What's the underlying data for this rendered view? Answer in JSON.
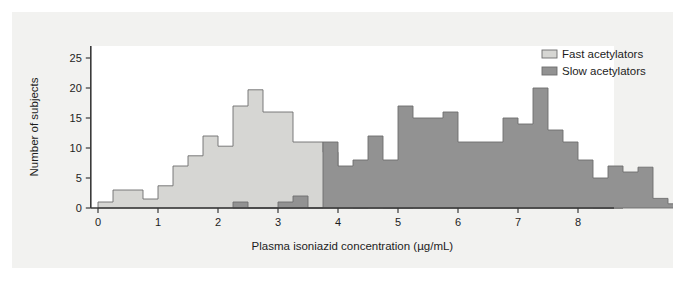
{
  "figure": {
    "background_color": "#f2f2f0",
    "plot_background_color": "#ffffff"
  },
  "chart_data": {
    "type": "bar",
    "title": "",
    "xlabel": "Plasma isoniazid concentration (µg/mL)",
    "ylabel": "Number of subjects",
    "xlim": [
      -0.12,
      8.6
    ],
    "ylim": [
      0,
      27
    ],
    "xticks": [
      0,
      1,
      2,
      3,
      4,
      5,
      6,
      7,
      8
    ],
    "xticklabels": [
      "0",
      "1",
      "2",
      "3",
      "4",
      "5",
      "6",
      "7",
      "8"
    ],
    "yticks": [
      0,
      5,
      10,
      15,
      20,
      25
    ],
    "yticklabels": [
      "0",
      "5",
      "10",
      "15",
      "20",
      "25"
    ],
    "grid": false,
    "bin_width": 0.25,
    "legend_position": "top-right",
    "legend": [
      {
        "name": "Fast acetylators",
        "color": "#d6d6d3"
      },
      {
        "name": "Slow acetylators",
        "color": "#929292"
      }
    ],
    "series": [
      {
        "name": "Fast acetylators",
        "color": "#d6d6d3",
        "edge_color": "#6e6e6e",
        "bin_start": 0.0,
        "bin_width": 0.25,
        "values": [
          1,
          3,
          3,
          1.5,
          3.7,
          7,
          8.7,
          12,
          10.3,
          17,
          19.7,
          16,
          16,
          11,
          11,
          9.3,
          6,
          0,
          1,
          0,
          0,
          1,
          3,
          2,
          1.3,
          1.3,
          1.3,
          1.3,
          1.3,
          0.7,
          0.7,
          0.7,
          0.7,
          0,
          0
        ]
      },
      {
        "name": "Slow acetylators",
        "color": "#929292",
        "edge_color": "#6e6e6e",
        "bin_start": 2.25,
        "bin_width": 0.25,
        "values": [
          1,
          0,
          0,
          1,
          2,
          0,
          11,
          7,
          8,
          12,
          8,
          17,
          15,
          15,
          16,
          11,
          11,
          11,
          15,
          14,
          20,
          13,
          11,
          8,
          5,
          7,
          6,
          6.8,
          1.6,
          0.7,
          1.6,
          5,
          1.6,
          0,
          2.2,
          1.2
        ]
      }
    ]
  }
}
